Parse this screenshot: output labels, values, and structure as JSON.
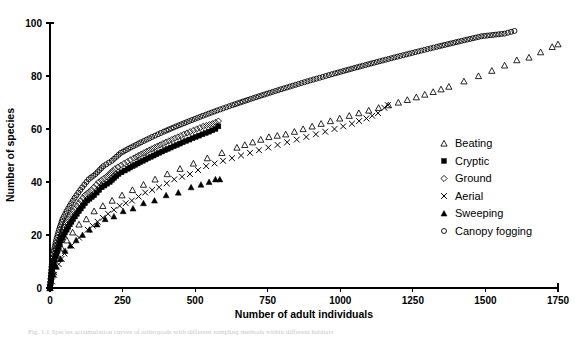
{
  "chart_data": {
    "type": "scatter",
    "title": "",
    "xlabel": "Number of adult individuals",
    "ylabel": "Number of species",
    "xlim": [
      0,
      1750
    ],
    "ylim": [
      0,
      100
    ],
    "xticks": [
      0,
      250,
      500,
      750,
      1000,
      1250,
      1500,
      1750
    ],
    "yticks": [
      0,
      20,
      40,
      60,
      80,
      100
    ],
    "grid": false,
    "legend_position": "right",
    "series": [
      {
        "name": "Beating",
        "marker": "open-triangle",
        "color": "#000000",
        "points": [
          [
            0,
            0
          ],
          [
            12,
            6
          ],
          [
            25,
            11
          ],
          [
            40,
            15
          ],
          [
            58,
            18
          ],
          [
            78,
            21
          ],
          [
            100,
            24
          ],
          [
            125,
            26
          ],
          [
            152,
            29
          ],
          [
            182,
            31
          ],
          [
            214,
            33
          ],
          [
            248,
            35
          ],
          [
            284,
            37
          ],
          [
            322,
            39
          ],
          [
            362,
            41
          ],
          [
            404,
            43
          ],
          [
            448,
            45
          ],
          [
            494,
            47
          ],
          [
            542,
            49
          ],
          [
            592,
            51
          ],
          [
            644,
            53
          ],
          [
            698,
            55
          ],
          [
            754,
            57
          ],
          [
            812,
            58
          ],
          [
            872,
            60
          ],
          [
            934,
            62
          ],
          [
            998,
            64
          ],
          [
            1064,
            66
          ],
          [
            1132,
            68
          ],
          [
            1200,
            70
          ],
          [
            1262,
            72
          ],
          [
            1320,
            74
          ],
          [
            1374,
            76
          ],
          [
            1426,
            78
          ],
          [
            1476,
            80
          ],
          [
            1522,
            82
          ],
          [
            1566,
            84
          ],
          [
            1608,
            86
          ],
          [
            1650,
            87
          ],
          [
            1690,
            89
          ],
          [
            1730,
            91
          ],
          [
            1750,
            92
          ]
        ]
      },
      {
        "name": "Cryptic",
        "marker": "filled-square",
        "color": "#000000",
        "points": [
          [
            0,
            0
          ],
          [
            8,
            7
          ],
          [
            16,
            11
          ],
          [
            26,
            14
          ],
          [
            38,
            18
          ],
          [
            52,
            21
          ],
          [
            68,
            24
          ],
          [
            86,
            27
          ],
          [
            106,
            30
          ],
          [
            128,
            33
          ],
          [
            152,
            35
          ],
          [
            178,
            38
          ],
          [
            206,
            40
          ],
          [
            236,
            43
          ],
          [
            268,
            45
          ],
          [
            302,
            47
          ],
          [
            338,
            49
          ],
          [
            376,
            51
          ],
          [
            416,
            53
          ],
          [
            458,
            55
          ],
          [
            502,
            57
          ],
          [
            548,
            59
          ],
          [
            570,
            60
          ],
          [
            580,
            61
          ]
        ]
      },
      {
        "name": "Ground",
        "marker": "open-diamond",
        "color": "#000000",
        "points": [
          [
            0,
            0
          ],
          [
            7,
            8
          ],
          [
            15,
            12
          ],
          [
            24,
            16
          ],
          [
            35,
            19
          ],
          [
            48,
            23
          ],
          [
            63,
            26
          ],
          [
            80,
            29
          ],
          [
            99,
            32
          ],
          [
            120,
            35
          ],
          [
            143,
            37
          ],
          [
            168,
            40
          ],
          [
            195,
            42
          ],
          [
            224,
            45
          ],
          [
            255,
            47
          ],
          [
            288,
            49
          ],
          [
            323,
            51
          ],
          [
            360,
            53
          ],
          [
            399,
            55
          ],
          [
            440,
            57
          ],
          [
            483,
            59
          ],
          [
            528,
            61
          ],
          [
            560,
            62
          ],
          [
            580,
            63
          ]
        ]
      },
      {
        "name": "Aerial",
        "marker": "cross-x",
        "color": "#000000",
        "points": [
          [
            0,
            0
          ],
          [
            14,
            5
          ],
          [
            30,
            9
          ],
          [
            50,
            13
          ],
          [
            74,
            16
          ],
          [
            100,
            19
          ],
          [
            130,
            22
          ],
          [
            164,
            25
          ],
          [
            200,
            28
          ],
          [
            240,
            31
          ],
          [
            282,
            33
          ],
          [
            328,
            36
          ],
          [
            376,
            38
          ],
          [
            428,
            41
          ],
          [
            482,
            43
          ],
          [
            538,
            46
          ],
          [
            596,
            48
          ],
          [
            658,
            50
          ],
          [
            720,
            52
          ],
          [
            784,
            54
          ],
          [
            850,
            56
          ],
          [
            916,
            58
          ],
          [
            980,
            60
          ],
          [
            1040,
            62
          ],
          [
            1090,
            64
          ],
          [
            1130,
            66
          ],
          [
            1152,
            68
          ],
          [
            1164,
            69
          ]
        ]
      },
      {
        "name": "Sweeping",
        "marker": "filled-triangle",
        "color": "#000000",
        "points": [
          [
            0,
            0
          ],
          [
            10,
            5
          ],
          [
            22,
            8
          ],
          [
            36,
            11
          ],
          [
            52,
            14
          ],
          [
            70,
            16
          ],
          [
            90,
            18
          ],
          [
            112,
            20
          ],
          [
            136,
            22
          ],
          [
            162,
            24
          ],
          [
            190,
            26
          ],
          [
            220,
            27
          ],
          [
            252,
            29
          ],
          [
            286,
            30
          ],
          [
            322,
            32
          ],
          [
            360,
            33
          ],
          [
            400,
            35
          ],
          [
            442,
            36
          ],
          [
            486,
            38
          ],
          [
            520,
            39
          ],
          [
            548,
            40
          ],
          [
            570,
            41
          ],
          [
            585,
            41
          ]
        ]
      },
      {
        "name": "Canopy fogging",
        "marker": "open-circle",
        "color": "#000000",
        "points": [
          [
            0,
            0
          ],
          [
            6,
            9
          ],
          [
            13,
            14
          ],
          [
            21,
            18
          ],
          [
            31,
            22
          ],
          [
            43,
            26
          ],
          [
            57,
            29
          ],
          [
            73,
            32
          ],
          [
            91,
            35
          ],
          [
            111,
            38
          ],
          [
            133,
            41
          ],
          [
            157,
            43
          ],
          [
            184,
            46
          ],
          [
            213,
            48
          ],
          [
            244,
            51
          ],
          [
            278,
            53
          ],
          [
            314,
            55
          ],
          [
            352,
            57
          ],
          [
            392,
            59
          ],
          [
            435,
            61
          ],
          [
            480,
            63
          ],
          [
            527,
            65
          ],
          [
            576,
            67
          ],
          [
            628,
            69
          ],
          [
            682,
            71
          ],
          [
            738,
            73
          ],
          [
            796,
            75
          ],
          [
            856,
            77
          ],
          [
            918,
            79
          ],
          [
            982,
            81
          ],
          [
            1048,
            83
          ],
          [
            1116,
            85
          ],
          [
            1186,
            87
          ],
          [
            1258,
            89
          ],
          [
            1332,
            91
          ],
          [
            1408,
            93
          ],
          [
            1486,
            95
          ],
          [
            1566,
            96
          ],
          [
            1600,
            97
          ]
        ]
      }
    ]
  },
  "axes": {
    "x_title": "Number of adult individuals",
    "y_title": "Number of species",
    "x_tick_labels": [
      "0",
      "250",
      "500",
      "750",
      "1000",
      "1250",
      "1500",
      "1750"
    ],
    "y_tick_labels": [
      "0",
      "20",
      "40",
      "60",
      "80",
      "100"
    ]
  },
  "legend": {
    "items": [
      {
        "label": "Beating",
        "marker": "open-triangle"
      },
      {
        "label": "Cryptic",
        "marker": "filled-square"
      },
      {
        "label": "Ground",
        "marker": "open-diamond"
      },
      {
        "label": "Aerial",
        "marker": "cross-x"
      },
      {
        "label": "Sweeping",
        "marker": "filled-triangle"
      },
      {
        "label": "Canopy fogging",
        "marker": "open-circle"
      }
    ]
  },
  "caption": {
    "text": "Fig. 1.1 Species accumulation curves of arthropods with different sampling methods within different habitats"
  },
  "colors": {
    "ink": "#000000",
    "background": "#ffffff"
  }
}
